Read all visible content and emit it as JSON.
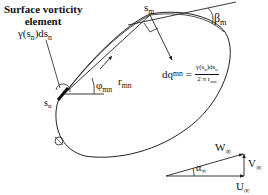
{
  "title": {
    "line1": "Surface vorticity",
    "line2": "element",
    "line3": "γ(s",
    "line3_sub": "n",
    "line3_mid": ")ds",
    "line3_sub2": "n"
  },
  "labels": {
    "s_m": "s",
    "s_m_sub": "m",
    "s_n": "s",
    "s_n_sub": "n",
    "r_mn": "r",
    "r_mn_sub": "mn",
    "phi_mn": "φ",
    "phi_mn_sub": "mn",
    "beta_m": "β",
    "beta_m_sub": "m"
  },
  "formula": {
    "lhs": "dq",
    "lhs_sub": "mn",
    "eq": "=",
    "num": "γ(s",
    "num_sub": "n",
    "num_mid": ")ds",
    "num_sub2": "n",
    "den": "2 π r",
    "den_sub": "mn"
  },
  "velocity_triangle": {
    "W": "W",
    "W_sub": "∞",
    "V": "V",
    "V_sub": "∞",
    "U": "U",
    "U_sub": "∞",
    "alpha": "α",
    "alpha_sub": "∞"
  },
  "colors": {
    "line": "#222222",
    "background": "#ffffff"
  }
}
